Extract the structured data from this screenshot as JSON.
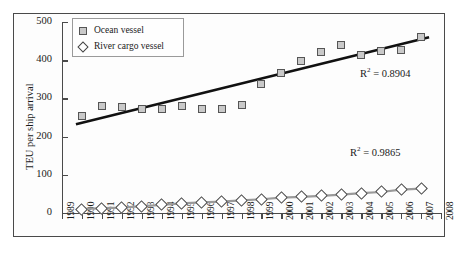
{
  "chart_data": {
    "type": "scatter",
    "title": "",
    "xlabel": "",
    "ylabel": "TEU per ship arrival",
    "xlim": [
      1989,
      2008
    ],
    "ylim": [
      0,
      500
    ],
    "grid": false,
    "legend_position": "top-left",
    "categories": [
      1990,
      1991,
      1992,
      1993,
      1994,
      1995,
      1996,
      1997,
      1998,
      1999,
      2000,
      2001,
      2002,
      2003,
      2004,
      2005,
      2006,
      2007
    ],
    "xticks": [
      "1989",
      "1990",
      "1991",
      "1992",
      "1993",
      "1994",
      "1995",
      "1996",
      "1997",
      "1998",
      "1999",
      "2000",
      "2001",
      "2002",
      "2003",
      "2004",
      "2005",
      "2006",
      "2007",
      "2008"
    ],
    "yticks": [
      "0",
      "100",
      "200",
      "300",
      "400",
      "500"
    ],
    "series": [
      {
        "name": "Ocean vessel",
        "marker": "square",
        "color": "#c9c9c9",
        "values": [
          253,
          280,
          277,
          272,
          272,
          281,
          272,
          272,
          283,
          338,
          366,
          398,
          421,
          441,
          413,
          423,
          428,
          462
        ],
        "trendline": {
          "label": "R² = 0.8904",
          "r2": 0.8904,
          "start": [
            1990,
            253
          ],
          "end": [
            2007,
            455
          ]
        }
      },
      {
        "name": "River cargo vessel",
        "marker": "diamond",
        "color": "#ffffff",
        "values": [
          10,
          13,
          14,
          18,
          21,
          25,
          28,
          30,
          33,
          36,
          40,
          42,
          45,
          48,
          52,
          55,
          61,
          64
        ],
        "trendline": {
          "label": "R² = 0.9865",
          "r2": 0.9865
        }
      }
    ],
    "annotations": [
      {
        "id": "r2-ocean",
        "text": "R² = 0.8904"
      },
      {
        "id": "r2-river",
        "text": "R² = 0.9865"
      }
    ]
  },
  "legend": {
    "items": [
      {
        "label": "Ocean vessel",
        "marker": "square"
      },
      {
        "label": "River cargo vessel",
        "marker": "diamond"
      }
    ]
  },
  "annotations": {
    "r2_ocean_prefix": "R",
    "r2_ocean_sup": "2",
    "r2_ocean_value": " = 0.8904",
    "r2_river_prefix": "R",
    "r2_river_sup": "2",
    "r2_river_value": " = 0.9865"
  },
  "axes": {
    "ylabel": "TEU per ship arrival",
    "yticks": [
      "500",
      "400",
      "300",
      "200",
      "100",
      "0"
    ],
    "xticks": [
      "1989",
      "1990",
      "1991",
      "1992",
      "1993",
      "1994",
      "1995",
      "1996",
      "1997",
      "1998",
      "1999",
      "2000",
      "2001",
      "2002",
      "2003",
      "2004",
      "2005",
      "2006",
      "2007",
      "2008"
    ]
  }
}
